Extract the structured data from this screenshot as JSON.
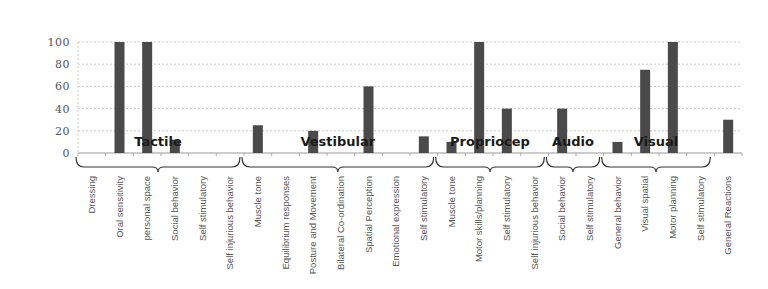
{
  "chart_data": {
    "type": "bar",
    "title": "",
    "xlabel": "",
    "ylabel": "",
    "ylim": [
      0,
      100
    ],
    "yticks": [
      0,
      20,
      40,
      60,
      80,
      100
    ],
    "grid": true,
    "legend": null,
    "bar_color": "#4a4a4a",
    "categories": [
      "Dressing",
      "Oral sensitivity",
      "personal space",
      "Social behavior",
      "Self stimulatory",
      "Self injurious behavior",
      "Muscle tone",
      "Equilibrium responses",
      "Posture and Movement",
      "Bilateral Co-ordination",
      "Spatial Perception",
      "Emotional expression",
      "Self stimulatory",
      "Muscle tone",
      "Motor skills/planning",
      "Self stimulatory",
      "Self injurious behavior",
      "Social behavior",
      "Self stimulatory",
      "General behavior",
      "Visual spatial",
      "Motor planning",
      "Self stimulatory",
      "General Reactions"
    ],
    "values": [
      0,
      100,
      100,
      12,
      0,
      0,
      25,
      0,
      20,
      0,
      60,
      0,
      15,
      10,
      100,
      40,
      0,
      40,
      0,
      10,
      75,
      100,
      0,
      30
    ],
    "groups": [
      {
        "label": "Tactile",
        "start": 0,
        "end": 5
      },
      {
        "label": "Vestibular",
        "start": 6,
        "end": 12
      },
      {
        "label": "Propriocep",
        "start": 13,
        "end": 16
      },
      {
        "label": "Audio",
        "start": 17,
        "end": 18
      },
      {
        "label": "Visual",
        "start": 19,
        "end": 22
      }
    ]
  }
}
